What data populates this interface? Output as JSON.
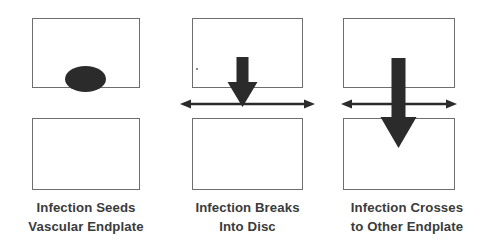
{
  "figure": {
    "type": "process-diagram",
    "orientation": "horizontal",
    "stage_count": 3,
    "background_color": "#ffffff",
    "line_color": "#6e6e6e",
    "arrow_color": "#2b2b2b",
    "text_color": "#3b3b3b",
    "lesion_color": "#2b2b2b"
  },
  "panels": [
    {
      "id": "panel-1",
      "caption_line1": "Infection Seeds",
      "caption_line2": "Vascular Endplate",
      "upper_box_label": "endplate-upper",
      "lower_box_label": "endplate-lower",
      "has_lesion": true,
      "has_vertical_arrow": false,
      "has_horizontal_arrow": false
    },
    {
      "id": "panel-2",
      "caption_line1": "Infection Breaks",
      "caption_line2": "Into Disc",
      "upper_box_label": "endplate-upper",
      "lower_box_label": "endplate-lower",
      "has_lesion": false,
      "has_vertical_arrow": true,
      "vertical_arrow_extent": "short",
      "has_horizontal_arrow": true
    },
    {
      "id": "panel-3",
      "caption_line1": "Infection Crosses",
      "caption_line2": "to Other Endplate",
      "upper_box_label": "endplate-upper",
      "lower_box_label": "endplate-lower",
      "has_lesion": false,
      "has_vertical_arrow": true,
      "vertical_arrow_extent": "long",
      "has_horizontal_arrow": true
    }
  ]
}
